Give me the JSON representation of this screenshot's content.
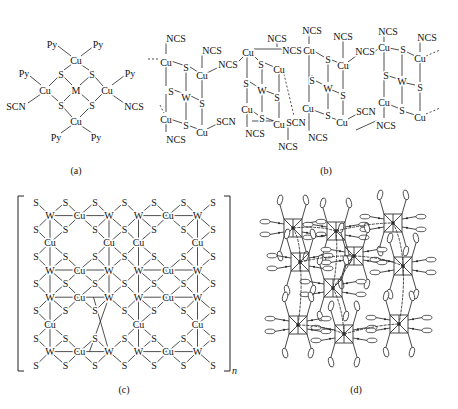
{
  "figure": {
    "panels": [
      {
        "id": "a",
        "caption": "(a)"
      },
      {
        "id": "b",
        "caption": "(b)"
      },
      {
        "id": "c",
        "caption": "(c)",
        "subscript": "n"
      },
      {
        "id": "d",
        "caption": "(d)"
      }
    ]
  },
  "panel_a": {
    "caption": "(a)",
    "atoms": [
      {
        "t": "Py",
        "x": 52,
        "y": 44
      },
      {
        "t": "Py",
        "x": 98,
        "y": 44
      },
      {
        "t": "Cu",
        "x": 76,
        "y": 60
      },
      {
        "t": "Py",
        "x": 24,
        "y": 73
      },
      {
        "t": "S",
        "x": 61,
        "y": 74
      },
      {
        "t": "S",
        "x": 92,
        "y": 74
      },
      {
        "t": "Py",
        "x": 130,
        "y": 73
      },
      {
        "t": "Cu",
        "x": 45,
        "y": 90
      },
      {
        "t": "M",
        "x": 76,
        "y": 90
      },
      {
        "t": "Cu",
        "x": 107,
        "y": 90
      },
      {
        "t": "SCN",
        "x": 16,
        "y": 106
      },
      {
        "t": "S",
        "x": 61,
        "y": 105
      },
      {
        "t": "S",
        "x": 92,
        "y": 105
      },
      {
        "t": "NCS",
        "x": 134,
        "y": 106
      },
      {
        "t": "Cu",
        "x": 76,
        "y": 121
      },
      {
        "t": "Py",
        "x": 56,
        "y": 137
      },
      {
        "t": "Py",
        "x": 96,
        "y": 137
      }
    ]
  },
  "panel_b": {
    "caption": "(b)",
    "atoms": [
      {
        "t": "NCS",
        "x": 176,
        "y": 38
      },
      {
        "t": "Cu",
        "x": 166,
        "y": 62
      },
      {
        "t": "NCS",
        "x": 212,
        "y": 50
      },
      {
        "t": "S",
        "x": 186,
        "y": 67
      },
      {
        "t": "Cu",
        "x": 202,
        "y": 75
      },
      {
        "t": "NCS",
        "x": 228,
        "y": 64
      },
      {
        "t": "S",
        "x": 171,
        "y": 91
      },
      {
        "t": "W",
        "x": 186,
        "y": 97
      },
      {
        "t": "S",
        "x": 202,
        "y": 103
      },
      {
        "t": "Cu",
        "x": 166,
        "y": 119
      },
      {
        "t": "S",
        "x": 186,
        "y": 125
      },
      {
        "t": "Cu",
        "x": 202,
        "y": 132
      },
      {
        "t": "SCN",
        "x": 226,
        "y": 121
      },
      {
        "t": "NCS",
        "x": 176,
        "y": 139
      },
      {
        "t": "Cu",
        "x": 248,
        "y": 52
      },
      {
        "t": "NCS",
        "x": 277,
        "y": 38
      },
      {
        "t": "NCS",
        "x": 292,
        "y": 50
      },
      {
        "t": "S",
        "x": 261,
        "y": 64
      },
      {
        "t": "Cu",
        "x": 279,
        "y": 69
      },
      {
        "t": "S",
        "x": 246,
        "y": 83
      },
      {
        "t": "W",
        "x": 262,
        "y": 90
      },
      {
        "t": "S",
        "x": 277,
        "y": 97
      },
      {
        "t": "Cu",
        "x": 247,
        "y": 109
      },
      {
        "t": "S",
        "x": 262,
        "y": 118
      },
      {
        "t": "Cu",
        "x": 279,
        "y": 124
      },
      {
        "t": "SCN",
        "x": 296,
        "y": 122
      },
      {
        "t": "NCS",
        "x": 255,
        "y": 133
      },
      {
        "t": "NCS",
        "x": 288,
        "y": 146
      },
      {
        "t": "NCS",
        "x": 312,
        "y": 30
      },
      {
        "t": "Cu",
        "x": 309,
        "y": 50
      },
      {
        "t": "NCS",
        "x": 343,
        "y": 36
      },
      {
        "t": "S",
        "x": 328,
        "y": 59
      },
      {
        "t": "Cu",
        "x": 343,
        "y": 65
      },
      {
        "t": "NCS",
        "x": 365,
        "y": 51
      },
      {
        "t": "S",
        "x": 312,
        "y": 80
      },
      {
        "t": "W",
        "x": 328,
        "y": 88
      },
      {
        "t": "S",
        "x": 343,
        "y": 95
      },
      {
        "t": "Cu",
        "x": 308,
        "y": 108
      },
      {
        "t": "S",
        "x": 328,
        "y": 115
      },
      {
        "t": "Cu",
        "x": 342,
        "y": 122
      },
      {
        "t": "SCN",
        "x": 366,
        "y": 111
      },
      {
        "t": "NCS",
        "x": 318,
        "y": 137
      },
      {
        "t": "NCS",
        "x": 388,
        "y": 31
      },
      {
        "t": "Cu",
        "x": 384,
        "y": 47
      },
      {
        "t": "S",
        "x": 403,
        "y": 49
      },
      {
        "t": "Cu",
        "x": 420,
        "y": 58
      },
      {
        "t": "NCS",
        "x": 427,
        "y": 37
      },
      {
        "t": "S",
        "x": 386,
        "y": 75
      },
      {
        "t": "W",
        "x": 402,
        "y": 81
      },
      {
        "t": "S",
        "x": 420,
        "y": 87
      },
      {
        "t": "Cu",
        "x": 384,
        "y": 102
      },
      {
        "t": "S",
        "x": 402,
        "y": 110
      },
      {
        "t": "Cu",
        "x": 420,
        "y": 117
      },
      {
        "t": "NCS",
        "x": 386,
        "y": 125
      }
    ]
  },
  "panel_c": {
    "caption": "(c)",
    "subscript": "n",
    "rows": [
      [
        "S",
        "S",
        "S",
        "S",
        "S",
        "S",
        "S"
      ],
      [
        "W",
        "Cu",
        "W",
        "W",
        "Cu",
        "W"
      ],
      [
        "S",
        "S",
        "S",
        "S",
        "S",
        "S",
        "S"
      ],
      [
        "Cu",
        "",
        "Cu",
        "Cu",
        "",
        "Cu"
      ],
      [
        "S",
        "S",
        "S",
        "S",
        "S",
        "S",
        "S"
      ],
      [
        "W",
        "Cu",
        "W",
        "W",
        "Cu",
        "W"
      ],
      [
        "S",
        "S",
        "S",
        "S",
        "S",
        "S",
        "S"
      ],
      [
        "W",
        "Cu",
        "W",
        "W",
        "Cu",
        "W"
      ],
      [
        "S",
        "S",
        "S",
        "S",
        "S",
        "S",
        "S"
      ],
      [
        "Cu",
        "",
        "",
        "Cu",
        "",
        "Cu"
      ],
      [
        "S",
        "S",
        "S",
        "S",
        "S",
        "S",
        "S"
      ],
      [
        "W",
        "Cu",
        "W",
        "W",
        "Cu",
        "W"
      ],
      [
        "S",
        "S",
        "S",
        "S",
        "S",
        "S",
        "S"
      ]
    ]
  },
  "panel_d": {
    "caption": "(d)",
    "description": "3D packing view of cluster-based framework with pyridine ligands"
  }
}
